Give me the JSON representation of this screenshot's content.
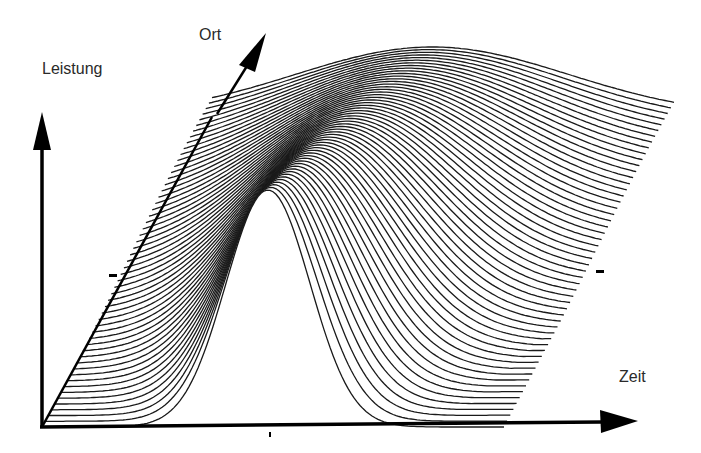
{
  "figure": {
    "type": "3d-waterfall-surface",
    "axes": {
      "vertical": {
        "label": "Leistung"
      },
      "depth": {
        "label": "Ort"
      },
      "horizontal": {
        "label": "Zeit"
      }
    },
    "tick_marks": 3,
    "line_count": 55,
    "line_color": "#1a1a1a",
    "axis_color": "#000000"
  },
  "chart_data": {
    "type": "surface-waterfall",
    "title": "",
    "xlabel": "Zeit",
    "ylabel": "Leistung",
    "zlabel": "Ort",
    "series": [
      {
        "name": "front profile (Ort min)",
        "peak_time_rel": 0.49,
        "peak_height_rel": 1.0,
        "width_rel": 0.09
      },
      {
        "name": "back profile (Ort max)",
        "peak_time_rel": 0.48,
        "peak_height_rel": 0.29,
        "width_rel": 0.28
      }
    ],
    "grid": false,
    "legend": null
  }
}
